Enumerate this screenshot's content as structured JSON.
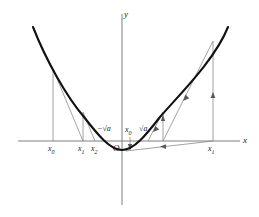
{
  "figure": {
    "name": "newton-method-sqrt-parabola",
    "background_color": "#ffffff",
    "curve_color": "#111111",
    "construction_color": "#7a7a7a",
    "axis_color": "#6f6f6f",
    "text_color": "#1a1a1a",
    "axes": {
      "x_label": "x",
      "y_label": "y",
      "origin_label": "O",
      "x_axis_y_px": 141,
      "y_axis_x_px": 122,
      "x_range_px": [
        18,
        243
      ],
      "y_range_px": [
        14,
        205
      ]
    },
    "labels": {
      "left_x0": "x",
      "left_x0_sub": "0",
      "left_x1": "x",
      "left_x1_sub": "1",
      "left_x2": "x",
      "left_x2_sub": "2",
      "neg_root": "−√a",
      "pos_root": "√a",
      "center_x0": "x",
      "center_x0_sub": "0",
      "right_x1": "x",
      "right_x1_sub": "1",
      "origin": "O",
      "axis_x": "x",
      "axis_y": "y"
    },
    "points_px": {
      "left_x0": 53,
      "left_x1": 83,
      "left_x2": 95,
      "neg_root": 105,
      "origin": 122,
      "center_x0": 130,
      "pos_root": 142,
      "mid_iterate": 163,
      "right_x1": 213
    },
    "curve_points_px": [
      [
        33,
        27
      ],
      [
        40,
        45
      ],
      [
        48,
        62
      ],
      [
        57,
        78
      ],
      [
        67,
        93
      ],
      [
        78,
        107
      ],
      [
        90,
        120
      ],
      [
        100,
        130
      ],
      [
        110,
        138
      ],
      [
        122,
        150
      ],
      [
        134,
        145
      ],
      [
        146,
        134
      ],
      [
        157,
        120
      ],
      [
        168,
        104
      ],
      [
        180,
        85
      ],
      [
        192,
        65
      ],
      [
        205,
        49
      ],
      [
        218,
        35
      ],
      [
        228,
        27
      ]
    ]
  }
}
